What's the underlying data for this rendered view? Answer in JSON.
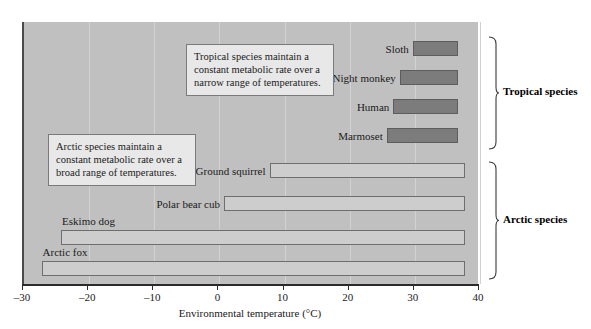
{
  "chart_data": {
    "type": "bar",
    "orientation": "horizontal",
    "title": "",
    "xlabel": "Environmental temperature (°C)",
    "ylabel": "",
    "xlim": [
      -30,
      40
    ],
    "xticks": [
      -30,
      -20,
      -10,
      0,
      10,
      20,
      30,
      40
    ],
    "xticklabels": [
      "–30",
      "–20",
      "–10",
      "0",
      "10",
      "20",
      "30",
      "40"
    ],
    "grid": true,
    "legend": "none",
    "plot_background": "#c0c0c0",
    "bar_colors": {
      "tropical": "#7c7c7c",
      "arctic": "#cdcdcd"
    },
    "note": "Each bar spans the thermoneutral zone (range of environmental temperature over which metabolic rate stays constant) for that species.",
    "series": [
      {
        "name": "Tropical species",
        "group": "tropical",
        "items": [
          {
            "label": "Sloth",
            "start": 30,
            "end": 37
          },
          {
            "label": "Night monkey",
            "start": 28,
            "end": 37
          },
          {
            "label": "Human",
            "start": 27,
            "end": 37
          },
          {
            "label": "Marmoset",
            "start": 26,
            "end": 37
          }
        ]
      },
      {
        "name": "Arctic species",
        "group": "arctic",
        "items": [
          {
            "label": "Ground squirrel",
            "start": 8,
            "end": 38
          },
          {
            "label": "Polar bear cub",
            "start": 1,
            "end": 38
          },
          {
            "label": "Eskimo dog",
            "start": -24,
            "end": 38
          },
          {
            "label": "Arctic fox",
            "start": -27,
            "end": 38
          }
        ]
      }
    ],
    "annotations": [
      {
        "id": "tropical-note",
        "text": "Tropical species maintain a constant metabolic rate over a narrow range of temperatures."
      },
      {
        "id": "arctic-note",
        "text": "Arctic species maintain a constant metabolic rate over a broad range of temperatures."
      }
    ],
    "brackets": [
      {
        "id": "tropical-bracket",
        "label": "Tropical species"
      },
      {
        "id": "arctic-bracket",
        "label": "Arctic species"
      }
    ]
  }
}
